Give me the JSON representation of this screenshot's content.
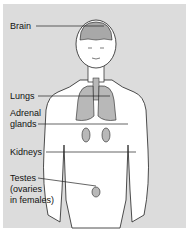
{
  "diagram": {
    "labels": [
      {
        "id": "brain",
        "text": "Brain"
      },
      {
        "id": "lungs",
        "text": "Lungs"
      },
      {
        "id": "adrenal",
        "line1": "Adrenal",
        "line2": "glands"
      },
      {
        "id": "kidneys",
        "text": "Kidneys"
      },
      {
        "id": "testes",
        "line1": "Testes",
        "line2": "(ovaries",
        "line3": "in females)"
      }
    ],
    "colors": {
      "background": "#dcdcdc",
      "body": "#ffffff",
      "organ": "#b8b8b8",
      "line": "#222222"
    }
  }
}
